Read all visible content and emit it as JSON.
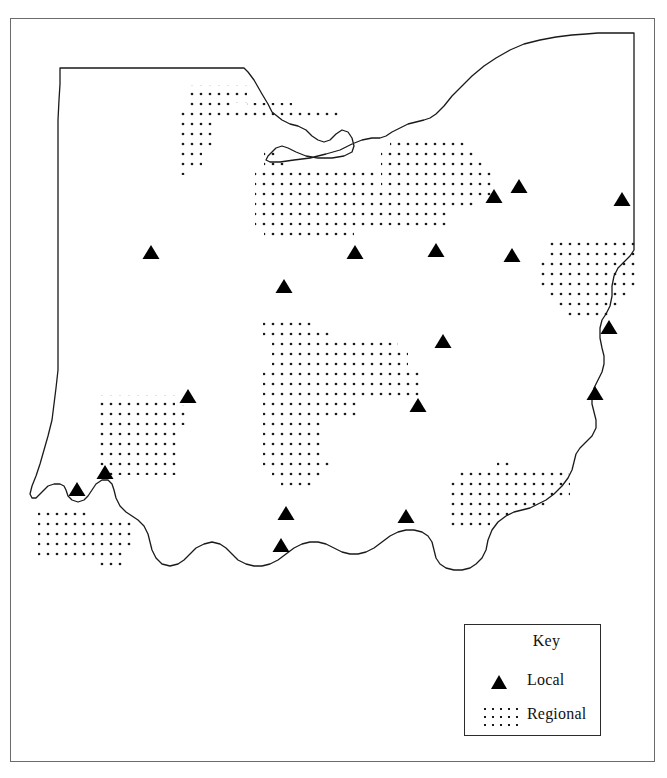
{
  "legend": {
    "title": "Key",
    "items": [
      {
        "symbol": "triangle-marker",
        "label": "Local"
      },
      {
        "symbol": "dot-pattern",
        "label": "Regional"
      }
    ]
  },
  "colors": {
    "frame": "#6b6b6b",
    "outline": "#1a1a1a",
    "marker": "#000000",
    "dot": "#1a1a1a",
    "background": "#ffffff"
  },
  "map_data": {
    "type": "map",
    "state_outline": "M 60,68 L 244,68 L 248,72 L 254,80 L 262,94 L 268,104 L 272,112 L 282,120 L 290,124 L 298,126 L 306,130 L 312,136 L 318,140 L 324,142 L 330,140 L 336,134 L 342,130 L 348,132 L 352,138 L 354,146 L 352,152 L 344,156 L 332,158 L 318,158 L 306,156 L 296,152 L 288,148 L 282,146 L 276,148 L 272,152 L 268,156 L 266,160 L 270,162 L 280,162 L 294,160 L 310,158 L 326,154 L 340,150 L 352,144 L 362,140 L 372,138 L 380,138 L 386,136 L 392,132 L 400,128 L 408,124 L 416,122 L 424,120 L 430,118 L 436,114 L 444,106 L 452,96 L 462,86 L 472,76 L 484,66 L 496,58 L 510,50 L 524,44 L 540,40 L 556,37 L 572,35 L 586,34 L 598,33 L 634,33 L 634,250 L 630,256 L 624,262 L 618,268 L 614,276 L 612,286 L 612,296 L 610,306 L 606,314 L 602,320 L 600,328 L 600,338 L 602,348 L 604,356 L 604,364 L 602,372 L 598,380 L 594,388 L 592,396 L 592,404 L 594,412 L 596,420 L 596,428 L 592,436 L 586,442 L 580,448 L 576,454 L 574,462 L 572,470 L 568,478 L 562,486 L 554,494 L 546,500 L 538,504 L 530,508 L 522,510 L 514,512 L 506,516 L 498,522 L 492,530 L 488,540 L 486,550 L 482,558 L 476,564 L 470,568 L 462,570 L 454,570 L 446,568 L 440,564 L 436,558 L 434,550 L 432,542 L 428,536 L 422,532 L 414,530 L 406,530 L 398,532 L 390,536 L 382,542 L 374,548 L 366,552 L 358,554 L 350,554 L 342,552 L 334,548 L 326,544 L 318,542 L 310,542 L 302,544 L 294,548 L 286,554 L 278,560 L 270,564 L 262,566 L 254,566 L 246,564 L 238,560 L 232,554 L 226,548 L 220,544 L 212,542 L 204,544 L 196,548 L 190,554 L 184,560 L 178,564 L 170,566 L 162,564 L 156,558 L 152,550 L 150,542 L 148,534 L 144,526 L 138,520 L 132,516 L 126,512 L 120,506 L 116,498 L 114,490 L 112,484 L 108,480 L 102,480 L 96,484 L 92,490 L 88,496 L 84,500 L 78,502 L 72,500 L 68,496 L 66,490 L 64,486 L 60,484 L 54,484 L 48,486 L 44,490 L 40,494 L 36,498 L 32,498 L 30,494 L 32,486 L 36,476 L 40,464 L 44,450 L 48,436 L 52,420 L 54,404 L 56,388 L 58,370 L 58,352 L 58,334 L 58,316 L 58,298 L 58,280 L 58,260 L 58,240 L 58,220 L 58,200 L 58,180 L 58,160 L 58,140 L 58,120 L 59,100 L 60,84 Z",
    "lake_erie_shore": "M 244,68 L 248,72 L 254,80 L 262,94 L 268,104 L 272,112 L 282,120 L 290,124 L 298,126 L 306,130 L 312,136 L 318,140 L 324,142 L 330,140 L 336,134 L 342,130 L 348,132 L 352,138 L 354,146 L 352,152 L 344,156 L 332,158 L 318,158 L 306,156 L 296,152 L 288,148 L 282,146 L 276,148 L 272,152 L 268,156 L 266,160 L 270,162 L 280,162 L 294,160 L 310,158",
    "markers": [
      {
        "name": "local-site",
        "x": 151,
        "y": 252
      },
      {
        "name": "local-site",
        "x": 284,
        "y": 286
      },
      {
        "name": "local-site",
        "x": 355,
        "y": 252
      },
      {
        "name": "local-site",
        "x": 436,
        "y": 250
      },
      {
        "name": "local-site",
        "x": 494,
        "y": 196
      },
      {
        "name": "local-site",
        "x": 519,
        "y": 186
      },
      {
        "name": "local-site",
        "x": 512,
        "y": 255
      },
      {
        "name": "local-site",
        "x": 622,
        "y": 199
      },
      {
        "name": "local-site",
        "x": 609,
        "y": 327
      },
      {
        "name": "local-site",
        "x": 443,
        "y": 341
      },
      {
        "name": "local-site",
        "x": 188,
        "y": 396
      },
      {
        "name": "local-site",
        "x": 418,
        "y": 405
      },
      {
        "name": "local-site",
        "x": 595,
        "y": 393
      },
      {
        "name": "local-site",
        "x": 105,
        "y": 472
      },
      {
        "name": "local-site",
        "x": 77,
        "y": 489
      },
      {
        "name": "local-site",
        "x": 286,
        "y": 513
      },
      {
        "name": "local-site",
        "x": 406,
        "y": 516
      },
      {
        "name": "local-site",
        "x": 281,
        "y": 545
      }
    ],
    "regions": [
      {
        "name": "regional-area-toledo",
        "cells": [
          [
            185,
            85,
            62,
            18
          ],
          [
            185,
            103,
            50,
            9
          ],
          [
            176,
            112,
            77,
            9
          ],
          [
            176,
            121,
            36,
            27
          ],
          [
            176,
            148,
            26,
            18
          ],
          [
            176,
            166,
            10,
            9
          ]
        ]
      },
      {
        "name": "regional-area-toledo-east",
        "cells": [
          [
            247,
            103,
            45,
            9
          ],
          [
            253,
            112,
            90,
            9
          ]
        ]
      },
      {
        "name": "regional-area-cleveland",
        "cells": [
          [
            390,
            138,
            78,
            10
          ],
          [
            381,
            148,
            95,
            10
          ],
          [
            381,
            158,
            104,
            10
          ],
          [
            381,
            168,
            113,
            10
          ],
          [
            381,
            178,
            113,
            10
          ],
          [
            372,
            188,
            122,
            10
          ],
          [
            372,
            198,
            105,
            10
          ],
          [
            372,
            208,
            78,
            10
          ],
          [
            372,
            218,
            78,
            10
          ],
          [
            264,
            148,
            14,
            10
          ],
          [
            264,
            158,
            25,
            10
          ],
          [
            255,
            168,
            120,
            10
          ],
          [
            255,
            178,
            120,
            10
          ],
          [
            255,
            188,
            117,
            10
          ],
          [
            255,
            198,
            117,
            10
          ],
          [
            255,
            208,
            117,
            10
          ],
          [
            255,
            218,
            117,
            10
          ],
          [
            264,
            228,
            90,
            10
          ]
        ]
      },
      {
        "name": "regional-area-youngstown",
        "cells": [
          [
            546,
            236,
            90,
            10
          ],
          [
            546,
            246,
            90,
            10
          ],
          [
            537,
            256,
            99,
            10
          ],
          [
            537,
            266,
            99,
            10
          ],
          [
            537,
            276,
            99,
            10
          ],
          [
            546,
            286,
            82,
            10
          ],
          [
            555,
            296,
            64,
            10
          ],
          [
            564,
            306,
            46,
            10
          ]
        ]
      },
      {
        "name": "regional-area-columbus",
        "cells": [
          [
            263,
            318,
            48,
            10
          ],
          [
            263,
            328,
            70,
            10
          ],
          [
            272,
            338,
            126,
            10
          ],
          [
            272,
            348,
            136,
            10
          ],
          [
            272,
            358,
            136,
            10
          ],
          [
            263,
            368,
            160,
            10
          ],
          [
            263,
            378,
            160,
            10
          ],
          [
            263,
            388,
            160,
            10
          ],
          [
            263,
            398,
            96,
            10
          ],
          [
            263,
            408,
            96,
            10
          ],
          [
            263,
            418,
            60,
            10
          ],
          [
            263,
            428,
            60,
            10
          ],
          [
            263,
            438,
            60,
            10
          ],
          [
            263,
            448,
            60,
            10
          ],
          [
            263,
            458,
            70,
            10
          ],
          [
            272,
            468,
            50,
            10
          ],
          [
            281,
            478,
            32,
            10
          ]
        ]
      },
      {
        "name": "regional-area-dayton",
        "cells": [
          [
            95,
            395,
            80,
            10
          ],
          [
            95,
            405,
            92,
            10
          ],
          [
            95,
            415,
            92,
            10
          ],
          [
            95,
            425,
            82,
            10
          ],
          [
            95,
            435,
            82,
            10
          ],
          [
            95,
            445,
            82,
            10
          ],
          [
            95,
            455,
            82,
            10
          ],
          [
            95,
            465,
            82,
            10
          ]
        ]
      },
      {
        "name": "regional-area-cincinnati",
        "cells": [
          [
            38,
            508,
            48,
            10
          ],
          [
            38,
            518,
            96,
            10
          ],
          [
            38,
            528,
            96,
            10
          ],
          [
            38,
            538,
            96,
            10
          ],
          [
            38,
            548,
            86,
            10
          ],
          [
            96,
            558,
            30,
            10
          ]
        ]
      },
      {
        "name": "regional-area-marietta",
        "cells": [
          [
            497,
            458,
            12,
            10
          ],
          [
            459,
            468,
            110,
            10
          ],
          [
            450,
            478,
            120,
            10
          ],
          [
            450,
            488,
            120,
            10
          ],
          [
            450,
            498,
            100,
            10
          ],
          [
            450,
            508,
            60,
            10
          ],
          [
            450,
            518,
            40,
            10
          ]
        ]
      }
    ]
  }
}
